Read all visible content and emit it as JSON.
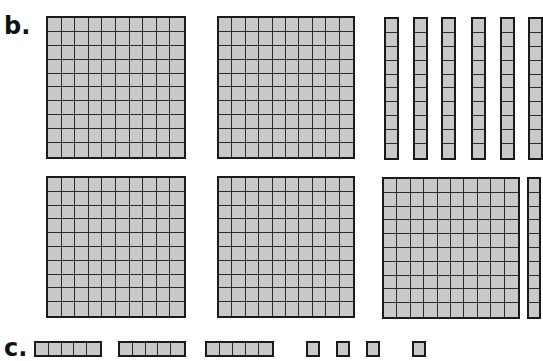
{
  "labels": {
    "b": "b.",
    "c": "c."
  },
  "colors": {
    "fill": "#c9c9c9",
    "line": "#2a2a2a",
    "border": "#1a1a1a"
  },
  "sections": {
    "b": {
      "hundreds": [
        {
          "x": 46,
          "y": 16,
          "w": 140,
          "h": 143
        },
        {
          "x": 217,
          "y": 16,
          "w": 138,
          "h": 143
        },
        {
          "x": 46,
          "y": 176,
          "w": 140,
          "h": 142
        },
        {
          "x": 217,
          "y": 176,
          "w": 138,
          "h": 142
        },
        {
          "x": 382,
          "y": 177,
          "w": 138,
          "h": 142
        },
        {
          "x": 527,
          "y": 177,
          "w": 14,
          "h": 142
        }
      ],
      "tens": [
        {
          "x": 384,
          "y": 17,
          "w": 15,
          "h": 143
        },
        {
          "x": 413,
          "y": 17,
          "w": 15,
          "h": 143
        },
        {
          "x": 441,
          "y": 17,
          "w": 15,
          "h": 143
        },
        {
          "x": 471,
          "y": 17,
          "w": 15,
          "h": 143
        },
        {
          "x": 500,
          "y": 17,
          "w": 15,
          "h": 143
        },
        {
          "x": 528,
          "y": 17,
          "w": 15,
          "h": 143
        }
      ]
    },
    "c": {
      "fives": [
        {
          "x": 34,
          "y": 341,
          "w": 68,
          "h": 16
        },
        {
          "x": 118,
          "y": 341,
          "w": 68,
          "h": 16
        },
        {
          "x": 205,
          "y": 341,
          "w": 69,
          "h": 16
        }
      ],
      "ones": [
        {
          "x": 306,
          "y": 341,
          "w": 14,
          "h": 16
        },
        {
          "x": 336,
          "y": 341,
          "w": 14,
          "h": 16
        },
        {
          "x": 366,
          "y": 341,
          "w": 14,
          "h": 16
        },
        {
          "x": 412,
          "y": 341,
          "w": 14,
          "h": 16
        }
      ]
    }
  }
}
